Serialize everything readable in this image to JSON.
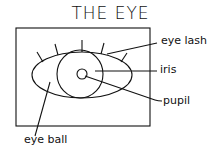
{
  "title": "THE EYE",
  "labels": {
    "eyelash": "eye lash",
    "iris": "iris",
    "pupil": "pupil",
    "eyeball": "eye ball"
  },
  "colors": {
    "stroke": "#111111",
    "background": "#ffffff"
  }
}
